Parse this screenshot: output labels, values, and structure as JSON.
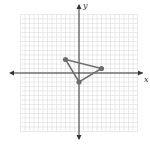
{
  "diagram": {
    "type": "coordinate-plane",
    "axis_labels": {
      "x": "x",
      "y": "y"
    },
    "grid": {
      "x_min": -13,
      "x_max": 13,
      "y_min": -13,
      "y_max": 13,
      "step": 1
    },
    "triangle": {
      "vertices": [
        {
          "name": "A",
          "x": -3,
          "y": 3
        },
        {
          "name": "B",
          "x": 5,
          "y": 1
        },
        {
          "name": "C",
          "x": 0,
          "y": -2
        }
      ]
    },
    "colors": {
      "grid": "#dcdcdc",
      "axis": "#333333",
      "shape": "#707070",
      "point": "#6e6e6e"
    }
  }
}
